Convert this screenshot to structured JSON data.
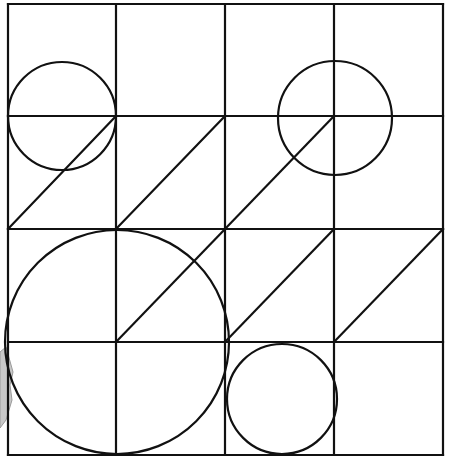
{
  "figure": {
    "grid": {
      "rows": 4,
      "cols": 4,
      "x_lines": [
        8,
        116,
        225,
        334,
        443
      ],
      "y_lines": [
        4,
        116,
        229,
        342,
        455
      ],
      "stroke": "#111111",
      "stroke_width": 2.2
    },
    "circles": [
      {
        "name": "circle-top-left",
        "cx": 62,
        "cy": 116,
        "r": 54
      },
      {
        "name": "circle-top-right",
        "cx": 335,
        "cy": 118,
        "r": 57
      },
      {
        "name": "circle-large-bottom-left",
        "cx": 117,
        "cy": 342,
        "r": 112
      },
      {
        "name": "circle-small-bottom",
        "cx": 282,
        "cy": 399,
        "r": 55
      }
    ],
    "diagonals": [
      {
        "x1": 8,
        "y1": 229,
        "x2": 116,
        "y2": 116
      },
      {
        "x1": 116,
        "y1": 229,
        "x2": 225,
        "y2": 116
      },
      {
        "x1": 225,
        "y1": 229,
        "x2": 334,
        "y2": 116
      },
      {
        "x1": 116,
        "y1": 342,
        "x2": 225,
        "y2": 229
      },
      {
        "x1": 225,
        "y1": 342,
        "x2": 334,
        "y2": 229
      },
      {
        "x1": 334,
        "y1": 342,
        "x2": 443,
        "y2": 229
      }
    ],
    "edge_artifact": {
      "color": "#c8c8c8",
      "stroke": "#9a9a9a"
    }
  }
}
